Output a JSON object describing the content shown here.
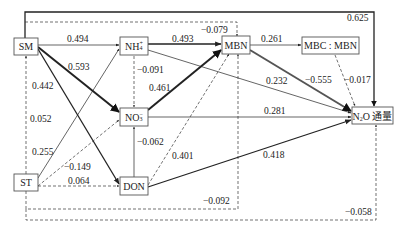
{
  "nodes": {
    "SM": {
      "label": "SM"
    },
    "ST": {
      "label": "ST"
    },
    "NH4": {
      "label": "NH",
      "sub": "4",
      "sup": "+"
    },
    "NO3": {
      "label": "NO",
      "sub": "3",
      "sup": "−"
    },
    "DON": {
      "label": "DON"
    },
    "MBN": {
      "label": "MBN"
    },
    "MBC_MBN": {
      "label": "MBC : MBN"
    },
    "N2O": {
      "label": "N",
      "sub": "2",
      "rest": "O 通量"
    }
  },
  "paths": [
    {
      "from": "SM",
      "to": "N2O",
      "coef": "0.625",
      "style": "solid"
    },
    {
      "from": "SM",
      "to": "MBN",
      "coef": "-0.079",
      "style": "dashed"
    },
    {
      "from": "SM",
      "to": "NH4",
      "coef": "0.494",
      "style": "solid"
    },
    {
      "from": "SM",
      "to": "NO3",
      "coef": "0.593",
      "style": "solid"
    },
    {
      "from": "SM",
      "to": "DON",
      "coef": "0.442",
      "style": "solid"
    },
    {
      "from": "ST",
      "to": "SM",
      "coef": "0.052",
      "style": "dashed"
    },
    {
      "from": "ST",
      "to": "NH4",
      "coef": "0.255",
      "style": "solid"
    },
    {
      "from": "ST",
      "to": "NO3",
      "coef": "-0.149",
      "style": "dashed"
    },
    {
      "from": "ST",
      "to": "DON",
      "coef": "0.064",
      "style": "dashed"
    },
    {
      "from": "ST",
      "to": "MBN",
      "coef": "-0.092",
      "style": "dashed"
    },
    {
      "from": "ST",
      "to": "N2O",
      "coef": "-0.058",
      "style": "dashed"
    },
    {
      "from": "NH4",
      "to": "MBN",
      "coef": "0.493",
      "style": "solid"
    },
    {
      "from": "NH4",
      "to": "NO3",
      "coef": "-0.091",
      "style": "dashed"
    },
    {
      "from": "NH4",
      "to": "N2O",
      "coef": "0.232",
      "style": "solid"
    },
    {
      "from": "NO3",
      "to": "MBN",
      "coef": "0.461",
      "style": "solid"
    },
    {
      "from": "NO3",
      "to": "N2O",
      "coef": "0.281",
      "style": "solid"
    },
    {
      "from": "DON",
      "to": "NO3",
      "coef": "-0.062",
      "style": "solid"
    },
    {
      "from": "DON",
      "to": "MBN",
      "coef": "0.401",
      "style": "dashed"
    },
    {
      "from": "DON",
      "to": "N2O",
      "coef": "0.418",
      "style": "solid"
    },
    {
      "from": "MBN",
      "to": "MBC_MBN",
      "coef": "0.261",
      "style": "solid"
    },
    {
      "from": "MBN",
      "to": "N2O",
      "coef": "-0.555",
      "style": "solid"
    },
    {
      "from": "MBC_MBN",
      "to": "N2O",
      "coef": "-0.017",
      "style": "dashed"
    }
  ],
  "labels": {
    "c0625": "0.625",
    "c0079": "−0.079",
    "c0494": "0.494",
    "c0593": "0.593",
    "c0442": "0.442",
    "c0052": "0.052",
    "c0255": "0.255",
    "c0149": "−0.149",
    "c0064": "0.064",
    "c0092": "−0.092",
    "c0058": "−0.058",
    "c0493": "0.493",
    "c0091": "−0.091",
    "c0232": "0.232",
    "c0461": "0.461",
    "c0281": "0.281",
    "c0062": "−0.062",
    "c0401": "0.401",
    "c0418": "0.418",
    "c0261": "0.261",
    "c0555": "−0.555",
    "c0017": "−0.017"
  }
}
